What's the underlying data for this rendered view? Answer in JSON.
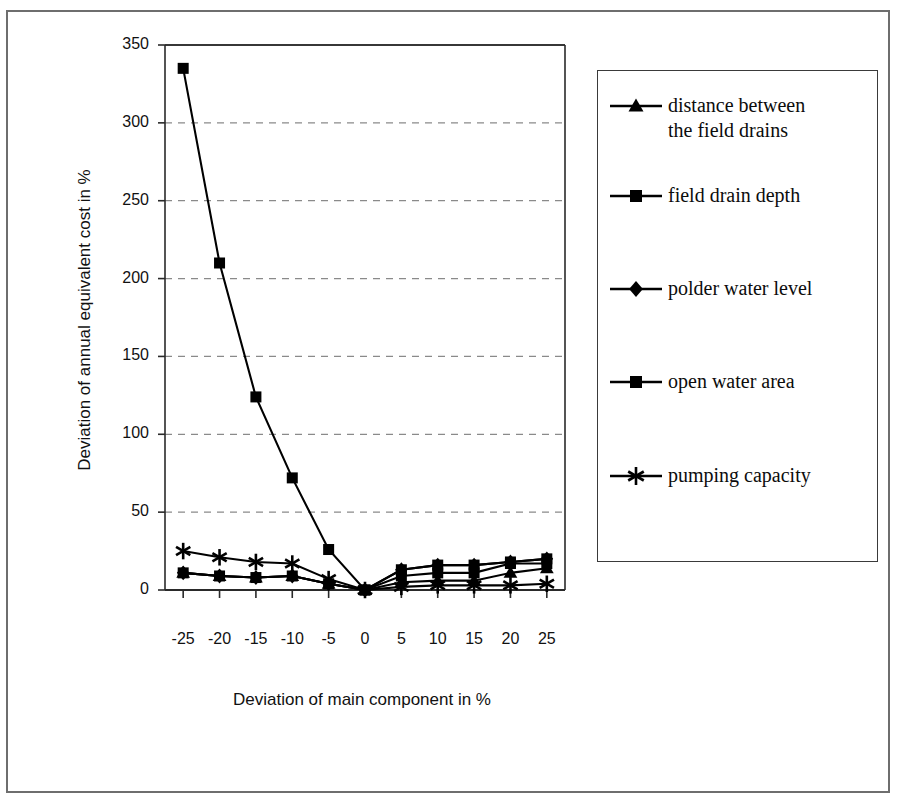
{
  "chart_data": {
    "type": "line",
    "title": "",
    "xlabel": "Deviation of main component in %",
    "ylabel": "Deviation of annual equivalent cost in %",
    "categories": [
      -25,
      -20,
      -15,
      -10,
      -5,
      0,
      5,
      10,
      15,
      20,
      25
    ],
    "xtick_labels": [
      "-25",
      "-20",
      "-15",
      "-10",
      "-5",
      "0",
      "5",
      "10",
      "15",
      "20",
      "25"
    ],
    "ytick_labels": [
      "0",
      "50",
      "100",
      "150",
      "200",
      "250",
      "300",
      "350"
    ],
    "ylim": [
      0,
      350
    ],
    "ytick_step": 50,
    "grid": "horizontal-dashed",
    "legend_position": "right",
    "series": [
      {
        "name": "distance between the field drains",
        "marker": "triangle",
        "values": [
          11,
          9,
          8,
          9,
          4,
          0,
          5,
          6,
          6,
          11,
          14
        ]
      },
      {
        "name": "field drain depth",
        "marker": "square",
        "values": [
          335,
          210,
          124,
          72,
          26,
          0,
          13,
          16,
          16,
          18,
          20
        ]
      },
      {
        "name": "polder water level",
        "marker": "diamond",
        "values": [
          11,
          9,
          8,
          9,
          4,
          0,
          13,
          16,
          16,
          18,
          20
        ]
      },
      {
        "name": "open water area",
        "marker": "square",
        "values": [
          11,
          9,
          8,
          9,
          4,
          0,
          9,
          11,
          11,
          17,
          17
        ]
      },
      {
        "name": "pumping capacity",
        "marker": "asterisk",
        "values": [
          25,
          21,
          18,
          17,
          7,
          0,
          2,
          3,
          3,
          3,
          4
        ]
      }
    ]
  },
  "legend": {
    "entries": [
      {
        "label_line1": "distance between",
        "label_line2": "the field drains",
        "marker": "triangle-icon"
      },
      {
        "label_line1": "field drain depth",
        "label_line2": "",
        "marker": "square-icon"
      },
      {
        "label_line1": "polder water level",
        "label_line2": "",
        "marker": "diamond-icon"
      },
      {
        "label_line1": "open water area",
        "label_line2": "",
        "marker": "square-icon"
      },
      {
        "label_line1": "pumping capacity",
        "label_line2": "",
        "marker": "asterisk-icon"
      }
    ]
  },
  "colors": {
    "series": "#000000",
    "grid": "#8a8a8a",
    "frame": "#2a2a2a",
    "outer_frame": "#6e6e6e",
    "background": "#ffffff",
    "text": "#111111"
  }
}
